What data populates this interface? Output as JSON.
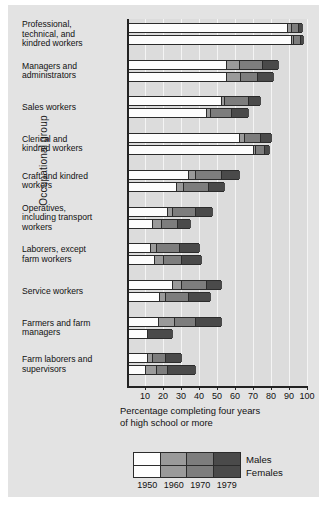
{
  "axes": {
    "ylabel": "Occupational group",
    "xtitle_line1": "Percentage completing four years",
    "xtitle_line2": "of high school or more",
    "xticks": [
      "10",
      "20",
      "30",
      "40",
      "50",
      "60",
      "70",
      "80",
      "90",
      "100"
    ]
  },
  "legend": {
    "series_labels": [
      "Males",
      "Females"
    ],
    "years": [
      "1950",
      "1960",
      "1970",
      "1979"
    ],
    "colors": [
      "#fdfdfd",
      "#9a9a9a",
      "#7d7d7d",
      "#4a4a4a"
    ]
  },
  "chart_data": {
    "type": "bar",
    "orientation": "horizontal",
    "stacking": "cumulative-nested",
    "title": "",
    "xlabel": "Percentage completing four years of high school or more",
    "ylabel": "Occupational group",
    "xlim": [
      0,
      100
    ],
    "grid": true,
    "legend_position": "bottom",
    "categories": [
      "Professional, technical, and kindred workers",
      "Managers and administrators",
      "Sales workers",
      "Clerical and kindred workers",
      "Craft and kindred workers",
      "Operatives, including transport workers",
      "Laborers, except farm workers",
      "Service workers",
      "Farmers and farm managers",
      "Farm laborers and supervisors"
    ],
    "year_series": [
      "1950",
      "1960",
      "1970",
      "1979"
    ],
    "series": [
      {
        "name": "Males",
        "values": [
          [
            89,
            91,
            95,
            97
          ],
          [
            55,
            62,
            75,
            84
          ],
          [
            52,
            54,
            67,
            74
          ],
          [
            62,
            65,
            74,
            80
          ],
          [
            34,
            38,
            52,
            62
          ],
          [
            22,
            25,
            38,
            47
          ],
          [
            13,
            16,
            29,
            40
          ],
          [
            25,
            30,
            44,
            52
          ],
          [
            17,
            26,
            38,
            52
          ],
          [
            11,
            14,
            21,
            30
          ]
        ]
      },
      {
        "name": "Females",
        "values": [
          [
            91,
            92,
            96,
            98
          ],
          [
            55,
            63,
            72,
            81
          ],
          [
            44,
            46,
            58,
            67
          ],
          [
            70,
            71,
            76,
            79
          ],
          [
            27,
            31,
            45,
            54
          ],
          [
            14,
            19,
            28,
            35
          ],
          [
            15,
            20,
            30,
            41
          ],
          [
            18,
            21,
            34,
            46
          ],
          [
            11,
            11,
            11,
            25
          ],
          [
            10,
            16,
            22,
            38
          ]
        ]
      }
    ]
  },
  "category_lines": [
    [
      "Professional,",
      "technical, and",
      "kindred workers"
    ],
    [
      "Managers and",
      "administrators"
    ],
    [
      "Sales workers"
    ],
    [
      "Clerical and",
      "kindred workers"
    ],
    [
      "Craft and kindred",
      "workers"
    ],
    [
      "Operatives,",
      "including transport",
      "workers"
    ],
    [
      "Laborers, except",
      "farm workers"
    ],
    [
      "Service workers"
    ],
    [
      "Farmers and farm",
      "managers"
    ],
    [
      "Farm laborers and",
      "supervisors"
    ]
  ]
}
